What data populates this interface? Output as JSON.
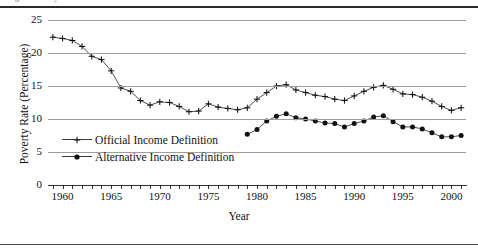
{
  "figure": {
    "caption_fragment": "Figure  Poverty rates under official and alternative income definitions",
    "axis": {
      "y_title": "Poverty Rate (Percentage)",
      "x_title": "Year",
      "y_ticks": [
        "0",
        "5",
        "10",
        "15",
        "20",
        "25"
      ],
      "x_ticks": [
        "1960",
        "1965",
        "1970",
        "1975",
        "1980",
        "1985",
        "1990",
        "1995",
        "2000"
      ]
    },
    "legend": {
      "items": [
        {
          "label": "Official Income Definition",
          "marker": "plus-marker",
          "color": "#111111"
        },
        {
          "label": "Alternative Income Definition",
          "marker": "dot-marker",
          "color": "#111111"
        }
      ]
    }
  },
  "chart_data": {
    "type": "line",
    "title": "",
    "subtitle": "",
    "xlabel": "Year",
    "ylabel": "Poverty Rate (Percentage)",
    "xlim": [
      1958.5,
      2001.5
    ],
    "ylim": [
      0,
      25
    ],
    "yticks": [
      0,
      5,
      10,
      15,
      20,
      25
    ],
    "xticks": [
      1960,
      1965,
      1970,
      1975,
      1980,
      1985,
      1990,
      1995,
      2000
    ],
    "grid": "horizontal",
    "legend_position": "inside-lower-left",
    "series": [
      {
        "name": "Official Income Definition",
        "marker": "plus",
        "color": "#111111",
        "x": [
          1959,
          1960,
          1961,
          1962,
          1963,
          1964,
          1965,
          1966,
          1967,
          1968,
          1969,
          1970,
          1971,
          1972,
          1973,
          1974,
          1975,
          1976,
          1977,
          1978,
          1979,
          1980,
          1981,
          1982,
          1983,
          1984,
          1985,
          1986,
          1987,
          1988,
          1989,
          1990,
          1991,
          1992,
          1993,
          1994,
          1995,
          1996,
          1997,
          1998,
          1999,
          2000,
          2001
        ],
        "values": [
          22.4,
          22.2,
          21.9,
          21.0,
          19.5,
          19.0,
          17.3,
          14.7,
          14.2,
          12.8,
          12.1,
          12.6,
          12.5,
          11.9,
          11.1,
          11.2,
          12.3,
          11.8,
          11.6,
          11.4,
          11.7,
          13.0,
          14.0,
          15.0,
          15.2,
          14.4,
          14.0,
          13.6,
          13.4,
          13.0,
          12.8,
          13.5,
          14.2,
          14.8,
          15.1,
          14.5,
          13.8,
          13.7,
          13.3,
          12.7,
          11.9,
          11.3,
          11.7
        ]
      },
      {
        "name": "Alternative Income Definition",
        "marker": "dot",
        "color": "#111111",
        "x": [
          1979,
          1980,
          1981,
          1982,
          1983,
          1984,
          1985,
          1986,
          1987,
          1988,
          1989,
          1990,
          1991,
          1992,
          1993,
          1994,
          1995,
          1996,
          1997,
          1998,
          1999,
          2000,
          2001
        ],
        "values": [
          7.7,
          8.4,
          9.7,
          10.4,
          10.8,
          10.2,
          10.0,
          9.7,
          9.4,
          9.3,
          8.8,
          9.3,
          9.7,
          10.3,
          10.5,
          9.6,
          8.8,
          8.8,
          8.5,
          7.9,
          7.3,
          7.3,
          7.5
        ]
      }
    ]
  }
}
